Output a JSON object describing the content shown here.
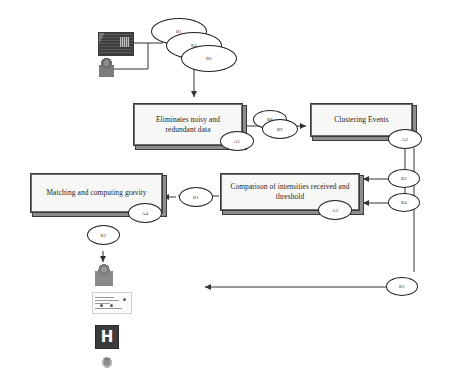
{
  "diagram": {
    "type": "flowchart",
    "colors": {
      "box_fill": "#f7f7f5",
      "box_border": "#3a3a3a",
      "box_shadow": "#8d8d8d",
      "line": "#333333",
      "tag_fill": "#ffffff",
      "tag_border": "#222222",
      "sign_fill": "#3b3b3b",
      "sign_text": "#ffffff"
    },
    "processes": [
      {
        "id": "p1",
        "label": "Eliminates noisy and redundant data",
        "tag": "A1"
      },
      {
        "id": "p2",
        "label": "Clustering Events",
        "tag": "A2"
      },
      {
        "id": "p3",
        "label": "Comparison of intensities received  and threshold",
        "tag": "A3"
      },
      {
        "id": "p4",
        "label": "Matching and computing gravity",
        "tag": "A4"
      }
    ],
    "tags": [
      {
        "id": "t_b1",
        "label": "B1"
      },
      {
        "id": "t_b4",
        "label": "B4"
      },
      {
        "id": "t_b6",
        "label": "B6"
      },
      {
        "id": "t_a1",
        "label": "A1"
      },
      {
        "id": "t_b8",
        "label": "B8"
      },
      {
        "id": "t_b9",
        "label": "B9"
      },
      {
        "id": "t_a2",
        "label": "A2"
      },
      {
        "id": "t_b3",
        "label": "B3"
      },
      {
        "id": "t_b4r",
        "label": "B4"
      },
      {
        "id": "t_a3",
        "label": "A3"
      },
      {
        "id": "t_b1m",
        "label": "B1"
      },
      {
        "id": "t_a4",
        "label": "A4"
      },
      {
        "id": "t_b2",
        "label": "B2"
      },
      {
        "id": "t_b5",
        "label": "B5"
      }
    ],
    "icons": [
      {
        "id": "sensor",
        "name": "sensor-board-image",
        "label": "Sensor board"
      },
      {
        "id": "person_top",
        "name": "person-image",
        "label": "Person"
      },
      {
        "id": "person_bottom",
        "name": "person-image",
        "label": "Person"
      },
      {
        "id": "report",
        "name": "report-document-image",
        "label": "Report"
      },
      {
        "id": "hospital",
        "name": "hospital-sign-icon",
        "label": "H"
      },
      {
        "id": "ambulance",
        "name": "ambulance-icon",
        "label": "Ambulance"
      }
    ]
  }
}
